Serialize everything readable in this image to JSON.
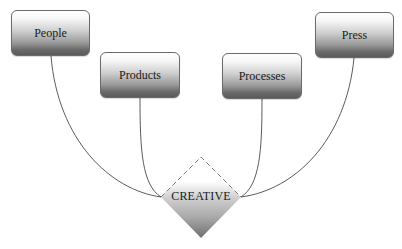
{
  "diagram": {
    "type": "hub-diagram",
    "center": {
      "label": "CREATIVE",
      "shape": "diamond",
      "border_style": "dashed-top"
    },
    "nodes": [
      {
        "id": "people",
        "label": "People",
        "connects_to": "center-left"
      },
      {
        "id": "products",
        "label": "Products",
        "connects_to": "center-left"
      },
      {
        "id": "processes",
        "label": "Processes",
        "connects_to": "center-right"
      },
      {
        "id": "press",
        "label": "Press",
        "connects_to": "center-right"
      }
    ],
    "colors": {
      "background": "#ffffff",
      "connector": "#4a4a4a",
      "box_border": "#6a6a6a",
      "box_gradient_top": "#ffffff",
      "box_gradient_bottom": "#5a5a5a",
      "diamond_dash": "#7a7a7a",
      "text": "#1a1a1a"
    }
  }
}
